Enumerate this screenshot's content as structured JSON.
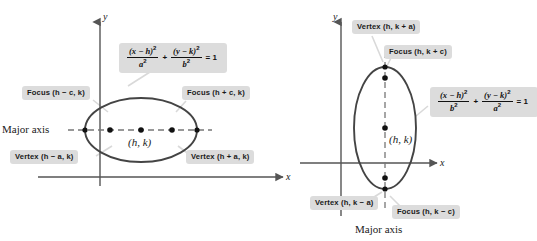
{
  "figure": {
    "title_semantic": "ellipse-standard-forms-diagram",
    "colors": {
      "label_box_bg": "#dcdcdc",
      "label_text": "#1a1a1a",
      "ellipse_stroke": "#444444",
      "axis_stroke": "#555555",
      "dash_stroke": "#777777",
      "leader_stroke": "#d8d8d8",
      "point_fill": "#111111",
      "background": "#ffffff"
    }
  },
  "left_panel": {
    "name": "horizontal-major-axis-ellipse",
    "axis_x_label": "x",
    "axis_y_label": "y",
    "center_label": "(h, k)",
    "major_axis_label": "Major axis",
    "focus_left": "Focus (h − c, k)",
    "focus_right": "Focus (h + c, k)",
    "vertex_left": "Vertex (h − a, k)",
    "vertex_right": "Vertex (h + a, k)",
    "equation": {
      "num1": "(x − h)",
      "den1": "a",
      "num2": "(y − k)",
      "den2": "b",
      "operator": "+",
      "equals": "= 1",
      "exponent": "2"
    }
  },
  "right_panel": {
    "name": "vertical-major-axis-ellipse",
    "axis_x_label": "x",
    "axis_y_label": "y",
    "center_label": "(h, k)",
    "major_axis_label": "Major axis",
    "vertex_top": "Vertex (h, k + a)",
    "focus_top": "Focus (h, k + c)",
    "vertex_bottom": "Vertex (h, k − a)",
    "focus_bottom": "Focus (h, k − c)",
    "equation": {
      "num1": "(x − h)",
      "den1": "b",
      "num2": "(y − k)",
      "den2": "a",
      "operator": "+",
      "equals": "= 1",
      "exponent": "2"
    }
  }
}
